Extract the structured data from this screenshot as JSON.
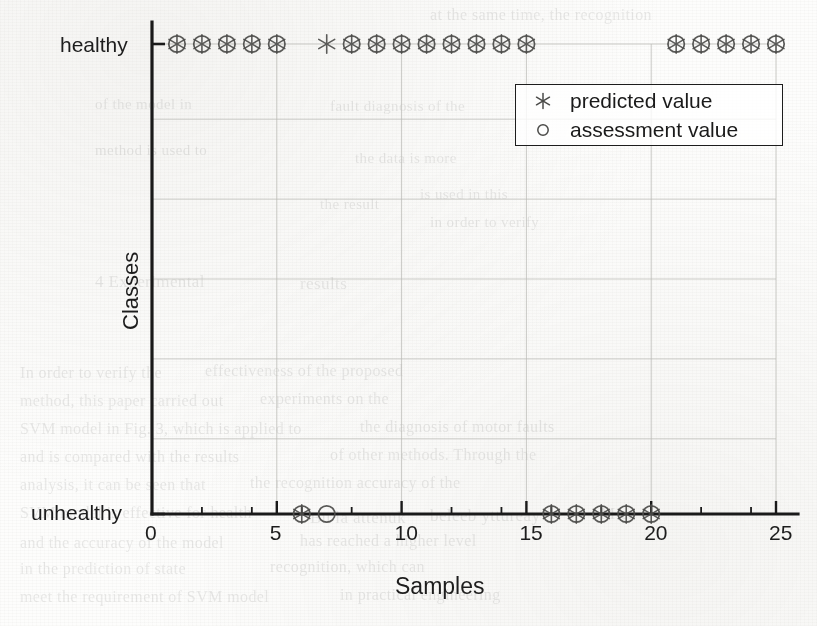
{
  "chart_data": {
    "type": "scatter",
    "title": "",
    "xlabel": "Samples",
    "ylabel": "Classes",
    "xlim": [
      0,
      25
    ],
    "xticks": [
      0,
      5,
      10,
      15,
      20,
      25
    ],
    "yticks": [
      "unhealthy",
      "healthy"
    ],
    "ycategories": [
      "unhealthy",
      "healthy"
    ],
    "grid": true,
    "legend_position": "upper right",
    "x": [
      1,
      2,
      3,
      4,
      5,
      6,
      7,
      8,
      9,
      10,
      11,
      12,
      13,
      14,
      15,
      16,
      17,
      18,
      19,
      20,
      21,
      22,
      23,
      24,
      25
    ],
    "series": [
      {
        "name": "predicted value",
        "marker": "asterisk",
        "values": [
          "healthy",
          "healthy",
          "healthy",
          "healthy",
          "healthy",
          "unhealthy",
          "healthy",
          "healthy",
          "healthy",
          "healthy",
          "healthy",
          "healthy",
          "healthy",
          "healthy",
          "healthy",
          "unhealthy",
          "unhealthy",
          "unhealthy",
          "unhealthy",
          "unhealthy",
          "healthy",
          "healthy",
          "healthy",
          "healthy",
          "healthy"
        ]
      },
      {
        "name": "assessment value",
        "marker": "circle",
        "values": [
          "healthy",
          "healthy",
          "healthy",
          "healthy",
          "healthy",
          "unhealthy",
          "unhealthy",
          "healthy",
          "healthy",
          "healthy",
          "healthy",
          "healthy",
          "healthy",
          "healthy",
          "healthy",
          "unhealthy",
          "unhealthy",
          "unhealthy",
          "unhealthy",
          "unhealthy",
          "healthy",
          "healthy",
          "healthy",
          "healthy",
          "healthy"
        ]
      }
    ]
  },
  "legend": {
    "entries": [
      {
        "label": "predicted value",
        "glyph": "✳"
      },
      {
        "label": "assessment value",
        "glyph": "○"
      }
    ]
  },
  "axes": {
    "ylabel": "Classes",
    "xlabel": "Samples",
    "ytick_top": "healthy",
    "ytick_bottom": "unhealthy",
    "xtick_labels": [
      "0",
      "5",
      "10",
      "15",
      "20",
      "25"
    ]
  },
  "bleed_text": [
    {
      "t": "at the same time, the recognition",
      "x": 430,
      "y": 6,
      "s": 16
    },
    {
      "t": "of the model in",
      "x": 95,
      "y": 96,
      "s": 15
    },
    {
      "t": "fault diagnosis of the",
      "x": 330,
      "y": 98,
      "s": 15
    },
    {
      "t": "method is used to",
      "x": 95,
      "y": 142,
      "s": 15
    },
    {
      "t": "the data is more",
      "x": 355,
      "y": 150,
      "s": 15
    },
    {
      "t": "is used in this",
      "x": 420,
      "y": 186,
      "s": 15
    },
    {
      "t": "the result",
      "x": 320,
      "y": 196,
      "s": 15
    },
    {
      "t": "in order to verify",
      "x": 430,
      "y": 214,
      "s": 15
    },
    {
      "t": "4  Experimental",
      "x": 95,
      "y": 272,
      "s": 17
    },
    {
      "t": "results",
      "x": 300,
      "y": 274,
      "s": 17
    },
    {
      "t": "In order to verify the",
      "x": 20,
      "y": 364,
      "s": 16
    },
    {
      "t": "effectiveness of the proposed",
      "x": 205,
      "y": 362,
      "s": 16
    },
    {
      "t": "method, this paper carried out",
      "x": 20,
      "y": 392,
      "s": 16
    },
    {
      "t": "experiments on the",
      "x": 260,
      "y": 390,
      "s": 16
    },
    {
      "t": "SVM model in Fig. 3, which is applied to",
      "x": 20,
      "y": 420,
      "s": 16
    },
    {
      "t": "the diagnosis of motor faults",
      "x": 360,
      "y": 418,
      "s": 16
    },
    {
      "t": "and is compared with the results",
      "x": 20,
      "y": 448,
      "s": 16
    },
    {
      "t": "of other methods. Through the",
      "x": 330,
      "y": 446,
      "s": 16
    },
    {
      "t": "analysis, it can be seen that",
      "x": 20,
      "y": 476,
      "s": 16
    },
    {
      "t": "the recognition accuracy of the",
      "x": 250,
      "y": 474,
      "s": 16
    },
    {
      "t": "SVM model is effective for health",
      "x": 20,
      "y": 504,
      "s": 16
    },
    {
      "t": "Bu  la  attenuk",
      "x": 310,
      "y": 508,
      "s": 17
    },
    {
      "t": "beleeb  yttureay",
      "x": 430,
      "y": 506,
      "s": 17
    },
    {
      "t": "M  c.",
      "x": 600,
      "y": 504,
      "s": 17
    },
    {
      "t": "and the accuracy of the model",
      "x": 20,
      "y": 534,
      "s": 16
    },
    {
      "t": "has reached a higher level",
      "x": 300,
      "y": 532,
      "s": 16
    },
    {
      "t": "in the prediction of state",
      "x": 20,
      "y": 560,
      "s": 16
    },
    {
      "t": "recognition, which can",
      "x": 270,
      "y": 558,
      "s": 16
    },
    {
      "t": "meet the requirement of SVM model",
      "x": 20,
      "y": 588,
      "s": 16
    },
    {
      "t": "in practical engineering",
      "x": 340,
      "y": 586,
      "s": 16
    }
  ]
}
